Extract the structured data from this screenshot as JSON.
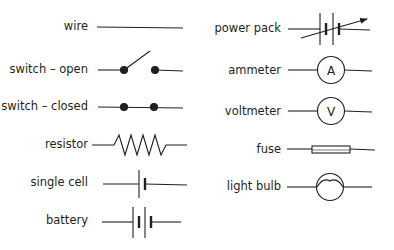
{
  "diagram": {
    "left_column": [
      {
        "key": "wire",
        "label": "wire"
      },
      {
        "key": "switch_open",
        "label": "switch – open"
      },
      {
        "key": "switch_closed",
        "label": "switch – closed"
      },
      {
        "key": "resistor",
        "label": "resistor"
      },
      {
        "key": "single_cell",
        "label": "single cell"
      },
      {
        "key": "battery",
        "label": "battery"
      }
    ],
    "right_column": [
      {
        "key": "power_pack",
        "label": "power pack"
      },
      {
        "key": "ammeter",
        "label": "ammeter",
        "symbol_letter": "A"
      },
      {
        "key": "voltmeter",
        "label": "voltmeter",
        "symbol_letter": "V"
      },
      {
        "key": "fuse",
        "label": "fuse"
      },
      {
        "key": "light_bulb",
        "label": "light bulb"
      }
    ]
  },
  "colors": {
    "stroke": "#231f20",
    "background": "#ffffff"
  }
}
